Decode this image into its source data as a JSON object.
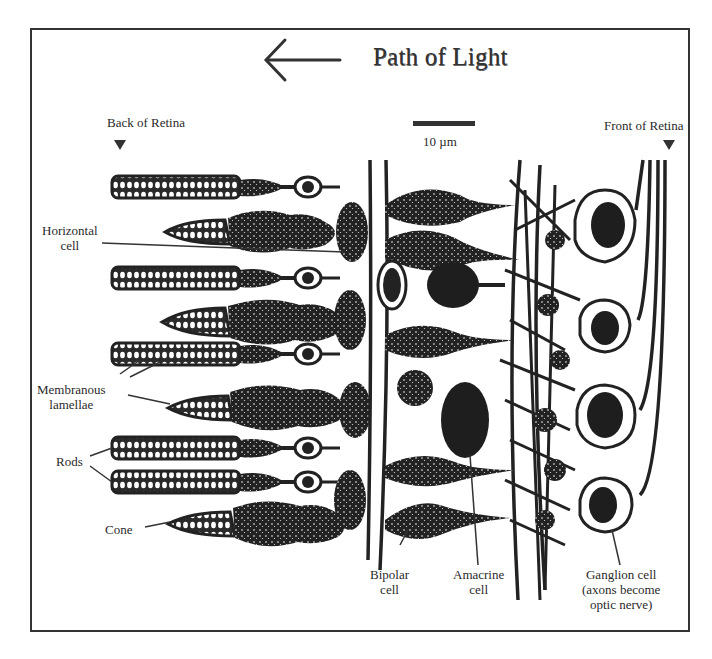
{
  "figure": {
    "title": "Path of Light",
    "direction_arrow": "left-arrow-icon",
    "markers": {
      "back": "Back of Retina",
      "front": "Front of Retina"
    },
    "scale_bar": {
      "label": "10 µm"
    }
  },
  "labels": {
    "horizontal_cell": [
      "Horizontal",
      "cell"
    ],
    "membranous_lamellae": [
      "Membranous",
      "lamellae"
    ],
    "rods": "Rods",
    "cone": "Cone",
    "bipolar_cell": [
      "Bipolar",
      "cell"
    ],
    "amacrine_cell": [
      "Amacrine",
      "cell"
    ],
    "ganglion_cell": [
      "Ganglion cell",
      "(axons become",
      "optic nerve)"
    ]
  },
  "photoreceptors": [
    {
      "type": "rod",
      "row": 1
    },
    {
      "type": "cone",
      "row": 2
    },
    {
      "type": "rod",
      "row": 3
    },
    {
      "type": "cone",
      "row": 4
    },
    {
      "type": "rod",
      "row": 5
    },
    {
      "type": "cone",
      "row": 6
    },
    {
      "type": "rod",
      "row": 7
    },
    {
      "type": "rod",
      "row": 8
    },
    {
      "type": "cone",
      "row": 9
    }
  ],
  "colors": {
    "ink": "#222222",
    "background": "#ffffff",
    "frame": "#333333"
  }
}
